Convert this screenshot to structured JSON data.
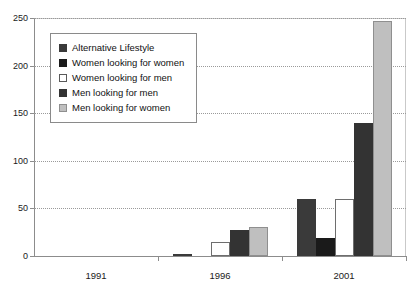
{
  "title_fragment": "Analysis",
  "chart_data": {
    "type": "bar",
    "title": "",
    "xlabel": "",
    "ylabel": "",
    "categories": [
      "1991",
      "1996",
      "2001"
    ],
    "ylim": [
      0,
      250
    ],
    "yticks": [
      0,
      50,
      100,
      150,
      200,
      250
    ],
    "grid": true,
    "legend_position": "upper-left-inside",
    "series": [
      {
        "name": "Alternative Lifestyle",
        "color": "#3a3a3a",
        "values": [
          0,
          2,
          60
        ]
      },
      {
        "name": "Women looking for women",
        "color": "#1a1a1a",
        "values": [
          0,
          0,
          19
        ]
      },
      {
        "name": "Women looking for men",
        "color": "#ffffff",
        "values": [
          0,
          15,
          60
        ]
      },
      {
        "name": "Men looking for men",
        "color": "#333333",
        "values": [
          0,
          27,
          140
        ]
      },
      {
        "name": "Men looking for women",
        "color": "#bfbfbf",
        "values": [
          0,
          31,
          247
        ]
      }
    ]
  }
}
